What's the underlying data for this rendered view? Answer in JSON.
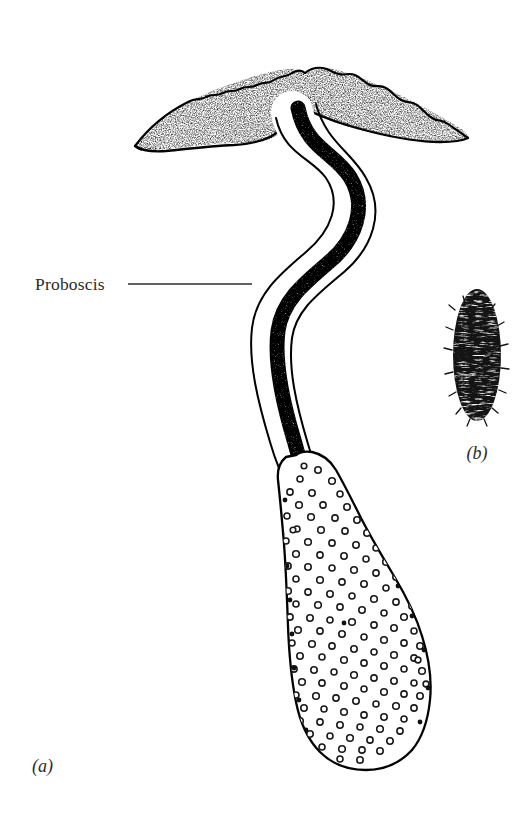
{
  "figure": {
    "background_color": "#ffffff",
    "ink_color": "#000000",
    "text_color": "#2b2b2b",
    "annotations": [
      {
        "id": "proboscis",
        "label": "Proboscis",
        "text_x": 35,
        "text_y": 290,
        "leader_from_x": 128,
        "leader_from_y": 284,
        "leader_to_x": 252,
        "leader_to_y": 284
      }
    ],
    "panels": [
      {
        "id": "panel-a",
        "label": "(a)",
        "x": 32,
        "y": 772,
        "description": "whole animal with proboscis, collar and trunk"
      },
      {
        "id": "panel-b",
        "label": "(b)",
        "x": 477,
        "y": 459,
        "description": "bristled ovoid specimen"
      }
    ],
    "parts": {
      "wing_collar": {
        "name": "collar",
        "fill": "#ffffff",
        "stipple": true,
        "left_tip_x": 135,
        "left_tip_y": 146,
        "right_tip_x": 468,
        "right_tip_y": 138
      },
      "proboscis_tube": {
        "name": "proboscis",
        "core_fill": "#111111",
        "sheath_fill": "#ffffff",
        "core_width": 13,
        "total_width": 40
      },
      "trunk": {
        "name": "trunk",
        "fill": "#ffffff",
        "papillae_count": 150,
        "top_y": 455,
        "bottom_y": 762,
        "widest_y": 625,
        "left_x": 268,
        "right_x": 432
      },
      "specimen_b": {
        "name": "bristled-ovoid",
        "center_x": 477,
        "center_y": 355,
        "rx": 24,
        "ry": 66,
        "fill": "#1a1a1a"
      }
    }
  }
}
